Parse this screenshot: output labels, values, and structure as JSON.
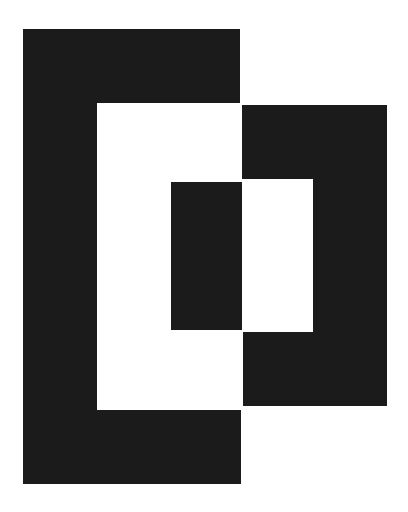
{
  "figure": {
    "colors": {
      "background": "#ffffff",
      "shape": "#1b1b1b"
    },
    "shapes": [
      {
        "name": "left-bracket",
        "parts": [
          {
            "x": 23,
            "y": 29,
            "w": 217,
            "h": 74
          },
          {
            "x": 23,
            "y": 29,
            "w": 74,
            "h": 455
          },
          {
            "x": 25,
            "y": 410,
            "w": 216,
            "h": 74
          }
        ]
      },
      {
        "name": "center-block",
        "parts": [
          {
            "x": 171,
            "y": 182,
            "w": 71,
            "h": 148
          }
        ]
      },
      {
        "name": "right-bracket",
        "parts": [
          {
            "x": 242,
            "y": 105,
            "w": 145,
            "h": 74
          },
          {
            "x": 313,
            "y": 105,
            "w": 74,
            "h": 301
          },
          {
            "x": 243,
            "y": 332,
            "w": 144,
            "h": 74
          }
        ]
      }
    ]
  }
}
